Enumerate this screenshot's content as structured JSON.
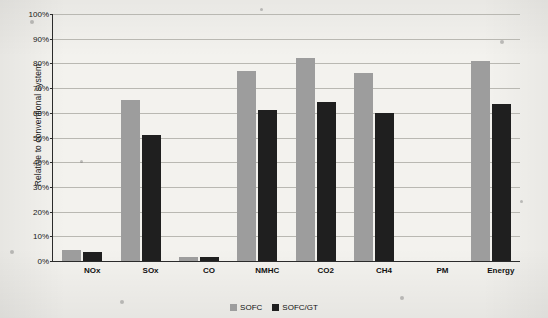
{
  "chart_data": {
    "type": "bar",
    "title": "",
    "xlabel": "",
    "ylabel": "Relative to conventional system",
    "ylim": [
      0,
      100
    ],
    "ytick_labels": [
      "0%",
      "10%",
      "20%",
      "30%",
      "40%",
      "50%",
      "60%",
      "70%",
      "80%",
      "90%",
      "100%"
    ],
    "ytick_values": [
      0,
      10,
      20,
      30,
      40,
      50,
      60,
      70,
      80,
      90,
      100
    ],
    "grid": true,
    "legend_position": "bottom-center",
    "categories": [
      "NOx",
      "SOx",
      "CO",
      "NMHC",
      "CO2",
      "CH4",
      "PM",
      "Energy"
    ],
    "series": [
      {
        "name": "SOFC",
        "color": "#9d9d9d",
        "values": [
          4.5,
          65,
          1.8,
          77,
          82,
          76,
          0,
          81
        ]
      },
      {
        "name": "SOFC/GT",
        "color": "#1f1f1f",
        "values": [
          3.5,
          51,
          1.5,
          61,
          64.5,
          60,
          0,
          63.5
        ]
      }
    ]
  },
  "legend": {
    "items": [
      {
        "label": "SOFC"
      },
      {
        "label": "SOFC/GT"
      }
    ]
  }
}
